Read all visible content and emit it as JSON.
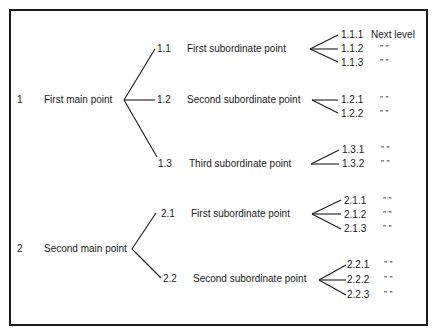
{
  "main_points": [
    {
      "num": "1",
      "label": "First main point"
    },
    {
      "num": "2",
      "label": "Second main point"
    }
  ],
  "subpoints": [
    {
      "num": "1.1",
      "label": "First subordinate point"
    },
    {
      "num": "1.2",
      "label": "Second subordinate point"
    },
    {
      "num": "1.3",
      "label": "Third subordinate point"
    },
    {
      "num": "2.1",
      "label": "First subordinate point"
    },
    {
      "num": "2.2",
      "label": "Second subordinate point"
    }
  ],
  "next_level": [
    {
      "num": "1.1.1",
      "label": "Next level"
    },
    {
      "num": "1.1.2",
      "label": "”     ”"
    },
    {
      "num": "1.1.3",
      "label": "”     ”"
    },
    {
      "num": "1.2.1",
      "label": "”     ”"
    },
    {
      "num": "1.2.2",
      "label": "”      ”"
    },
    {
      "num": "1.3.1",
      "label": "”     ”"
    },
    {
      "num": "1.3.2",
      "label": "”     ”"
    },
    {
      "num": "2.1.1",
      "label": "”     ”"
    },
    {
      "num": "2.1.2",
      "label": "”     ”"
    },
    {
      "num": "2.1.3",
      "label": "”     ”"
    },
    {
      "num": "2.2.1",
      "label": "”     ”"
    },
    {
      "num": "2.2.2",
      "label": "”     ”"
    },
    {
      "num": "2.2.3",
      "label": "”     ”"
    }
  ]
}
